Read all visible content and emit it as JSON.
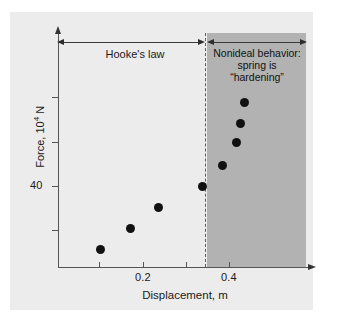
{
  "chart_data": {
    "type": "scatter",
    "title": "",
    "xlabel": "Displacement, m",
    "ylabel": "Force, 10⁴ N",
    "ylabel_text": "Force, 10",
    "ylabel_exponent": "4",
    "ylabel_unit": " N",
    "x_tick_labels": [
      "0.2",
      "0.4"
    ],
    "y_tick_labels": [
      "40"
    ],
    "xlim": [
      0.0,
      0.58
    ],
    "ylim": [
      0,
      100
    ],
    "grid": false,
    "legend_position": "none",
    "x": [
      0.095,
      0.163,
      0.225,
      0.325,
      0.355,
      0.388,
      0.396,
      0.405,
      0.418
    ],
    "y": [
      22,
      30,
      35,
      40,
      43,
      47,
      51,
      55,
      60
    ],
    "points": [
      {
        "x": 0.095,
        "y": 22,
        "px": 100,
        "py": 249
      },
      {
        "x": 0.163,
        "y": 30,
        "px": 130,
        "py": 228
      },
      {
        "x": 0.225,
        "y": 35,
        "px": 158,
        "py": 207
      },
      {
        "x": 0.325,
        "y": 40,
        "px": 202,
        "py": 186
      },
      {
        "x": 0.355,
        "y": 45,
        "px": 222,
        "py": 165
      },
      {
        "x": 0.388,
        "y": 50,
        "px": 236,
        "py": 142
      },
      {
        "x": 0.396,
        "y": 55,
        "px": 240,
        "py": 123
      },
      {
        "x": 0.418,
        "y": 60,
        "px": 244,
        "py": 102
      }
    ],
    "regions": [
      {
        "name": "hooke",
        "label": "Hooke's law",
        "x_start": 0.0,
        "x_end": 0.325
      },
      {
        "name": "nonideal",
        "label": "Nonideal behavior: spring is \"hardening\"",
        "x_start": 0.325,
        "x_end": 0.58,
        "shaded": true
      }
    ]
  },
  "annotations": {
    "hooke_label": "Hooke's law",
    "nonideal_line1": "Nonideal behavior:",
    "nonideal_line2": "spring is",
    "nonideal_line3": "“hardening”"
  },
  "axes": {
    "y_tick_40": "40",
    "x_tick_02": "0.2",
    "x_tick_04": "0.4",
    "x_title": "Displacement, m",
    "y_title_prefix": "Force, 10",
    "y_title_sup": "4",
    "y_title_suffix": " N"
  },
  "colors": {
    "panel_background": "#ececec",
    "shaded_region": "#b2b2b2",
    "axis": "#555555",
    "data_point": "#111111",
    "divider": "#5c5c5c",
    "text": "#1a1a1a"
  }
}
